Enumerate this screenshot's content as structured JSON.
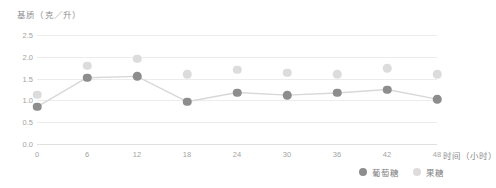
{
  "chart_data": {
    "type": "scatter",
    "title": "",
    "ylabel": "基质（克／升）",
    "xlabel": "时间（小时）",
    "x": [
      0,
      6,
      12,
      18,
      24,
      30,
      36,
      42,
      48
    ],
    "xtick_labels": [
      "0",
      "6",
      "12",
      "18",
      "24",
      "30",
      "36",
      "42",
      "48"
    ],
    "ytick_labels": [
      "2.5",
      "2.0",
      "1.5",
      "1.0",
      "0.5",
      "0.0"
    ],
    "yticks": [
      2.5,
      2.0,
      1.5,
      1.0,
      0.5,
      0.0
    ],
    "ylim": [
      0.0,
      2.5
    ],
    "xlim": [
      0,
      48
    ],
    "grid": true,
    "legend_position": "bottom-right",
    "series": [
      {
        "name": "葡萄糖",
        "color": "#8d8d8d",
        "line": true,
        "values": [
          0.85,
          1.52,
          1.55,
          0.97,
          1.18,
          1.12,
          1.17,
          1.25,
          1.03
        ]
      },
      {
        "name": "果糖",
        "color": "#dcdcdc",
        "line": false,
        "values": [
          1.13,
          1.79,
          1.96,
          1.6,
          1.7,
          1.63,
          1.6,
          1.74,
          1.6
        ]
      }
    ]
  }
}
